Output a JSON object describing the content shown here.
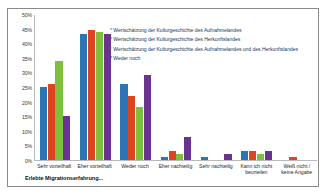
{
  "chart_data": {
    "type": "bar",
    "title": "",
    "xlabel": "Erlebte Migrationserfahrung...",
    "ylabel": "",
    "ylim": [
      0,
      50
    ],
    "ytick_labels": [
      "50%",
      "45%",
      "40%",
      "35%",
      "30%",
      "25%",
      "20%",
      "15%",
      "10%",
      "5%",
      "0%"
    ],
    "ytick_values": [
      50,
      45,
      40,
      35,
      30,
      25,
      20,
      15,
      10,
      5,
      0
    ],
    "grid": false,
    "legend_position": "inside-top-right",
    "legend_marker": "*",
    "categories": [
      "Sehr vorteilhaft",
      "Eher vorteilhaft",
      "Weder noch",
      "Eher nachteilig",
      "Sehr nachteilig",
      "Kann ich nicht beurteilen",
      "Weiß nicht / keine Angabe"
    ],
    "series": [
      {
        "name": "Wertschätzung der Kulturgeschichte des Aufnahmelandes",
        "color": "#2b74b5",
        "values": [
          25,
          43,
          26,
          1,
          1,
          3,
          0
        ]
      },
      {
        "name": "Wertschätzung der Kulturgeschichte des Herkunftslandes",
        "color": "#e0431f",
        "values": [
          26,
          44.5,
          22,
          3,
          0,
          3,
          1
        ]
      },
      {
        "name": "Wertschätzung der Kulturgeschichte des Aufnahmelandes und des Herkunftslandes",
        "color": "#7cc03b",
        "values": [
          34,
          44,
          18,
          2,
          0,
          2,
          0
        ]
      },
      {
        "name": "Weder noch",
        "color": "#6b3391",
        "values": [
          15,
          43,
          29,
          8,
          2,
          3,
          0
        ]
      }
    ]
  }
}
